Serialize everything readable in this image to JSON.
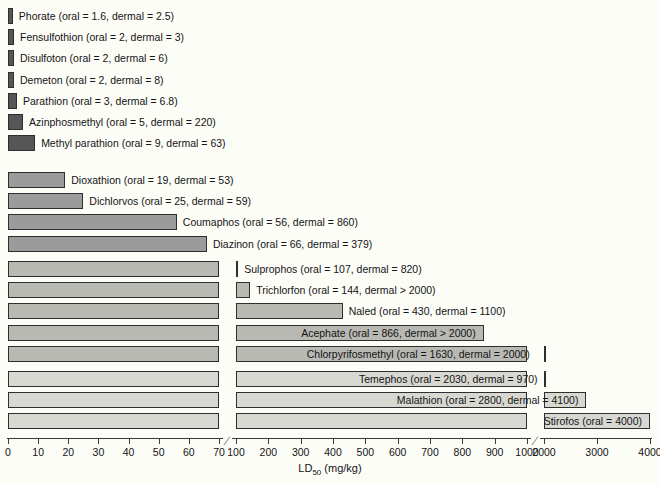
{
  "chart_data": {
    "type": "bar",
    "title": "",
    "xlabel": "LD50 (mg/kg)",
    "xlabel_main": "LD",
    "xlabel_sub": "50",
    "xlabel_unit": " (mg/kg)",
    "ylabel": "",
    "orientation": "horizontal",
    "grid": false,
    "legend": "none",
    "axis_note": "broken x-axis with three linear segments",
    "axis_segments": [
      {
        "from": 0,
        "to": 70,
        "ticks": [
          0,
          10,
          20,
          30,
          40,
          50,
          60,
          70
        ]
      },
      {
        "from": 100,
        "to": 1000,
        "ticks": [
          100,
          200,
          300,
          400,
          500,
          600,
          700,
          800,
          900,
          1000
        ]
      },
      {
        "from": 2000,
        "to": 4000,
        "ticks": [
          2000,
          3000,
          4000
        ]
      }
    ],
    "breaks": [
      70,
      1000
    ],
    "categories": [
      "Phorate",
      "Fensulfothion",
      "Disulfoton",
      "Demeton",
      "Parathion",
      "Azinphosmethyl",
      "Methyl parathion",
      "Dioxathion",
      "Dichlorvos",
      "Coumaphos",
      "Diazinon",
      "Sulprophos",
      "Trichlorfon",
      "Naled",
      "Acephate",
      "Chlorpyrifosmethyl",
      "Temephos",
      "Malathion",
      "Stirofos"
    ],
    "values": [
      1.6,
      2,
      2,
      2,
      3,
      5,
      9,
      19,
      25,
      56,
      66,
      107,
      144,
      430,
      866,
      1630,
      2030,
      2800,
      4000
    ],
    "groups": [
      {
        "id": "g1",
        "color": "#565656",
        "rows": [
          {
            "name": "Phorate",
            "oral": 1.6,
            "dermal": 2.5,
            "label": "Phorate (oral = 1.6, dermal = 2.5)"
          },
          {
            "name": "Fensulfothion",
            "oral": 2,
            "dermal": 3,
            "label": "Fensulfothion (oral = 2, dermal = 3)"
          },
          {
            "name": "Disulfoton",
            "oral": 2,
            "dermal": 6,
            "label": "Disulfoton (oral = 2, dermal = 6)"
          },
          {
            "name": "Demeton",
            "oral": 2,
            "dermal": 8,
            "label": "Demeton (oral = 2, dermal = 8)"
          },
          {
            "name": "Parathion",
            "oral": 3,
            "dermal": 6.8,
            "label": "Parathion (oral = 3, dermal = 6.8)"
          },
          {
            "name": "Azinphosmethyl",
            "oral": 5,
            "dermal": 220,
            "label": "Azinphosmethyl (oral = 5, dermal = 220)"
          },
          {
            "name": "Methyl parathion",
            "oral": 9,
            "dermal": 63,
            "label": "Methyl parathion (oral = 9, dermal = 63)"
          }
        ]
      },
      {
        "id": "g2",
        "color": "#9b9b9b",
        "rows": [
          {
            "name": "Dioxathion",
            "oral": 19,
            "dermal": 53,
            "label": "Dioxathion (oral = 19, dermal = 53)"
          },
          {
            "name": "Dichlorvos",
            "oral": 25,
            "dermal": 59,
            "label": "Dichlorvos (oral = 25, dermal = 59)"
          },
          {
            "name": "Coumaphos",
            "oral": 56,
            "dermal": 860,
            "label": "Coumaphos (oral = 56, dermal = 860)"
          },
          {
            "name": "Diazinon",
            "oral": 66,
            "dermal": 379,
            "label": "Diazinon (oral = 66, dermal = 379)"
          }
        ]
      },
      {
        "id": "g3",
        "color": "#b9b9b4",
        "rows": [
          {
            "name": "Sulprophos",
            "oral": 107,
            "dermal": 820,
            "label": "Sulprophos (oral = 107, dermal = 820)"
          },
          {
            "name": "Trichlorfon",
            "oral": 144,
            "dermal": 2000,
            "label": "Trichlorfon (oral = 144, dermal > 2000)"
          },
          {
            "name": "Naled",
            "oral": 430,
            "dermal": 1100,
            "label": "Naled (oral = 430, dermal = 1100)"
          },
          {
            "name": "Acephate",
            "oral": 866,
            "dermal": 2000,
            "label": "Acephate (oral = 866, dermal > 2000)"
          },
          {
            "name": "Chlorpyrifosmethyl",
            "oral": 1630,
            "dermal": 2000,
            "label": "Chlorpyrifosmethyl (oral = 1630, dermal = 2000)"
          }
        ]
      },
      {
        "id": "g4",
        "color": "#d8d8d2",
        "rows": [
          {
            "name": "Temephos",
            "oral": 2030,
            "dermal": 970,
            "label": "Temephos (oral = 2030, dermal = 970)"
          },
          {
            "name": "Malathion",
            "oral": 2800,
            "dermal": 4100,
            "label": "Malathion (oral = 2800, dermal = 4100)"
          },
          {
            "name": "Stirofos",
            "oral": 4000,
            "dermal": null,
            "label": "Stirofos (oral = 4000)"
          }
        ]
      }
    ]
  },
  "axis": {
    "labels": [
      "0",
      "10",
      "20",
      "30",
      "40",
      "50",
      "60",
      "70",
      "100",
      "200",
      "300",
      "400",
      "500",
      "600",
      "700",
      "800",
      "900",
      "1000",
      "2000",
      "3000",
      "4000"
    ],
    "title_main": "LD",
    "title_sub": "50",
    "title_unit": " (mg/kg)"
  }
}
